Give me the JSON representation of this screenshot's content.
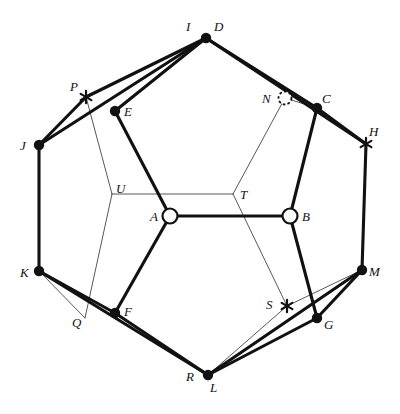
{
  "figure": {
    "canvas": {
      "width": 400,
      "height": 414
    },
    "colors": {
      "ink": "#111111",
      "thin_line": "#444444",
      "background": "#ffffff"
    }
  },
  "points": {
    "A": {
      "label": "A",
      "x": 170,
      "y": 216,
      "marker": "open-circle",
      "label_x": 150,
      "label_y": 210
    },
    "B": {
      "label": "B",
      "x": 290,
      "y": 216,
      "marker": "open-circle",
      "label_x": 302,
      "label_y": 210
    },
    "C": {
      "label": "C",
      "x": 317,
      "y": 108,
      "marker": "filled-dot",
      "label_x": 322,
      "label_y": 92
    },
    "D": {
      "label": "D",
      "x": 206,
      "y": 38,
      "marker": "filled-dot",
      "label_x": 214,
      "label_y": 20
    },
    "E": {
      "label": "E",
      "x": 115,
      "y": 111,
      "marker": "filled-dot",
      "label_x": 124,
      "label_y": 105
    },
    "F": {
      "label": "F",
      "x": 115,
      "y": 313,
      "marker": "filled-dot",
      "label_x": 124,
      "label_y": 305
    },
    "G": {
      "label": "G",
      "x": 317,
      "y": 318,
      "marker": "filled-dot",
      "label_x": 324,
      "label_y": 318
    },
    "H": {
      "label": "H",
      "x": 366,
      "y": 144,
      "marker": "asterisk",
      "label_x": 369,
      "label_y": 125
    },
    "I": {
      "label": "I",
      "x": 206,
      "y": 38,
      "marker": "none",
      "label_x": 186,
      "label_y": 20
    },
    "J": {
      "label": "J",
      "x": 39,
      "y": 145,
      "marker": "filled-dot",
      "label_x": 20,
      "label_y": 139
    },
    "K": {
      "label": "K",
      "x": 39,
      "y": 271,
      "marker": "filled-dot",
      "label_x": 20,
      "label_y": 266
    },
    "L": {
      "label": "L",
      "x": 208,
      "y": 375,
      "marker": "filled-dot",
      "label_x": 210,
      "label_y": 381
    },
    "M": {
      "label": "M",
      "x": 362,
      "y": 270,
      "marker": "filled-dot",
      "label_x": 369,
      "label_y": 265
    },
    "N": {
      "label": "N",
      "x": 285,
      "y": 98,
      "marker": "dashed-circle",
      "label_x": 262,
      "label_y": 92
    },
    "P": {
      "label": "P",
      "x": 86,
      "y": 97,
      "marker": "asterisk",
      "label_x": 70,
      "label_y": 80
    },
    "Q": {
      "label": "Q",
      "x": 85,
      "y": 318,
      "marker": "none",
      "label_x": 72,
      "label_y": 316
    },
    "R": {
      "label": "R",
      "x": 208,
      "y": 375,
      "marker": "none",
      "label_x": 186,
      "label_y": 370
    },
    "S": {
      "label": "S",
      "x": 287,
      "y": 306,
      "marker": "asterisk",
      "label_x": 266,
      "label_y": 298
    },
    "T": {
      "label": "T",
      "x": 233,
      "y": 194,
      "marker": "none",
      "label_x": 240,
      "label_y": 188
    },
    "U": {
      "label": "U",
      "x": 112,
      "y": 194,
      "marker": "none",
      "label_x": 116,
      "label_y": 182
    }
  },
  "thick_edges": [
    {
      "name": "edge-D-E",
      "from": "D",
      "to": "E"
    },
    {
      "name": "edge-D-C",
      "from": "D",
      "to": "C"
    },
    {
      "name": "edge-I-J",
      "from": "I",
      "to": "J"
    },
    {
      "name": "edge-J-P",
      "from": "J",
      "to": "P"
    },
    {
      "name": "edge-P-D",
      "from": "P",
      "to": "D"
    },
    {
      "name": "edge-C-H",
      "from": "C",
      "to": "H"
    },
    {
      "name": "edge-D-H",
      "from": "D",
      "to": "H"
    },
    {
      "name": "edge-J-K",
      "from": "J",
      "to": "K"
    },
    {
      "name": "edge-H-M",
      "from": "H",
      "to": "M"
    },
    {
      "name": "edge-K-F",
      "from": "K",
      "to": "F"
    },
    {
      "name": "edge-K-L",
      "from": "K",
      "to": "L"
    },
    {
      "name": "edge-F-L",
      "from": "F",
      "to": "L"
    },
    {
      "name": "edge-L-G",
      "from": "L",
      "to": "G"
    },
    {
      "name": "edge-G-M",
      "from": "G",
      "to": "M"
    },
    {
      "name": "edge-L-M",
      "from": "L",
      "to": "M"
    },
    {
      "name": "edge-E-A",
      "from": "E",
      "to": "A"
    },
    {
      "name": "edge-A-F",
      "from": "A",
      "to": "F"
    },
    {
      "name": "edge-A-B",
      "from": "A",
      "to": "B"
    },
    {
      "name": "edge-B-C",
      "from": "B",
      "to": "C"
    },
    {
      "name": "edge-B-G",
      "from": "B",
      "to": "G"
    }
  ],
  "thin_edges": [
    {
      "name": "thin-P-U",
      "from": "P",
      "to": "U"
    },
    {
      "name": "thin-U-Q",
      "from": "U",
      "to": "Q"
    },
    {
      "name": "thin-U-T",
      "from": "U",
      "to": "T"
    },
    {
      "name": "thin-T-N",
      "from": "T",
      "to": "N"
    },
    {
      "name": "thin-T-S",
      "from": "T",
      "to": "S"
    },
    {
      "name": "thin-S-R",
      "from": "S",
      "to": "R"
    },
    {
      "name": "thin-S-M",
      "from": "S",
      "to": "M"
    },
    {
      "name": "thin-K-Q",
      "from": "K",
      "to": "Q"
    },
    {
      "name": "thin-N-C",
      "from": "N",
      "to": "C"
    }
  ]
}
